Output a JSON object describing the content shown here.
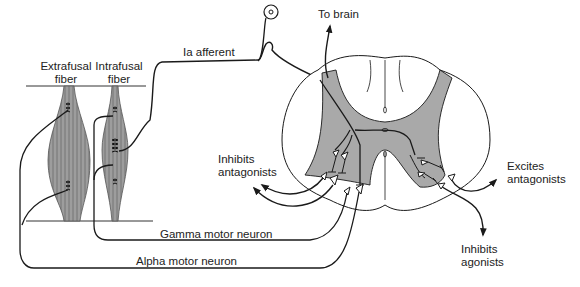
{
  "diagram": {
    "type": "neuroanatomy",
    "colors": {
      "gray_matter": "#a9a9a9",
      "muscle_fill": "#9a9a9a",
      "line": "#1a1a1a",
      "background": "#ffffff"
    },
    "labels": {
      "extrafusal_line1": "Extrafusal",
      "extrafusal_line2": "fiber",
      "intrafusal_line1": "Intrafusal",
      "intrafusal_line2": "fiber",
      "ia_afferent": "Ia afferent",
      "to_brain": "To brain",
      "inhibits_antagonists_line1": "Inhibits",
      "inhibits_antagonists_line2": "antagonists",
      "excites_antagonists_line1": "Excites",
      "excites_antagonists_line2": "antagonists",
      "inhibits_agonists_line1": "Inhibits",
      "inhibits_agonists_line2": "agonists",
      "gamma_motor_neuron": "Gamma motor neuron",
      "alpha_motor_neuron": "Alpha motor neuron"
    },
    "nodes": [
      {
        "id": "extrafusal_fiber",
        "label": "Extrafusal fiber"
      },
      {
        "id": "intrafusal_fiber",
        "label": "Intrafusal fiber"
      },
      {
        "id": "dorsal_root_ganglion",
        "label": ""
      },
      {
        "id": "spinal_cord",
        "label": ""
      }
    ],
    "edges": [
      {
        "from": "intrafusal_fiber",
        "to": "spinal_cord",
        "label": "Ia afferent"
      },
      {
        "from": "spinal_cord",
        "to": "brain",
        "label": "To brain"
      },
      {
        "from": "spinal_cord",
        "to": "intrafusal_fiber",
        "label": "Gamma motor neuron"
      },
      {
        "from": "spinal_cord",
        "to": "extrafusal_fiber",
        "label": "Alpha motor neuron"
      },
      {
        "from": "spinal_cord",
        "to": "antagonists",
        "label": "Inhibits antagonists"
      },
      {
        "from": "spinal_cord",
        "to": "antagonists_contralateral",
        "label": "Excites antagonists"
      },
      {
        "from": "spinal_cord",
        "to": "agonists_contralateral",
        "label": "Inhibits agonists"
      }
    ]
  }
}
